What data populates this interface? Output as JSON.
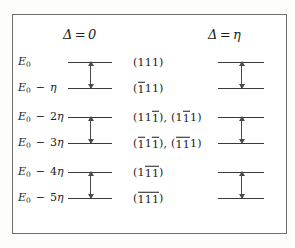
{
  "figure": {
    "kind": "energy-level-diagram",
    "columns": [
      {
        "id": "delta-zero",
        "symbol": "Δ",
        "equals": "=",
        "value": "0"
      },
      {
        "id": "delta-eta",
        "symbol": "Δ",
        "equals": "=",
        "value": "η"
      }
    ],
    "energy_labels": [
      {
        "base": "E",
        "sub": "0",
        "op": "",
        "coef": "",
        "unit": ""
      },
      {
        "base": "E",
        "sub": "0",
        "op": "−",
        "coef": "",
        "unit": "η"
      },
      {
        "base": "E",
        "sub": "0",
        "op": "−",
        "coef": "2",
        "unit": "η"
      },
      {
        "base": "E",
        "sub": "0",
        "op": "−",
        "coef": "3",
        "unit": "η"
      },
      {
        "base": "E",
        "sub": "0",
        "op": "−",
        "coef": "4",
        "unit": "η"
      },
      {
        "base": "E",
        "sub": "0",
        "op": "−",
        "coef": "5",
        "unit": "η"
      }
    ],
    "miller_labels": [
      {
        "row": 0,
        "groups": [
          {
            "open": "(",
            "digits": [
              {
                "d": "1",
                "bar": false
              },
              {
                "d": "1",
                "bar": false
              },
              {
                "d": "1",
                "bar": false
              }
            ],
            "close": ")"
          }
        ]
      },
      {
        "row": 1,
        "groups": [
          {
            "open": "(",
            "digits": [
              {
                "d": "1",
                "bar": true
              },
              {
                "d": "1",
                "bar": false
              },
              {
                "d": "1",
                "bar": false
              }
            ],
            "close": ")"
          }
        ]
      },
      {
        "row": 2,
        "groups": [
          {
            "open": "(",
            "digits": [
              {
                "d": "1",
                "bar": false
              },
              {
                "d": "1",
                "bar": false
              },
              {
                "d": "1",
                "bar": true
              }
            ],
            "close": ")"
          },
          {
            "open": "(",
            "digits": [
              {
                "d": "1",
                "bar": false
              },
              {
                "d": "1",
                "bar": true
              },
              {
                "d": "1",
                "bar": false
              }
            ],
            "close": ")"
          }
        ]
      },
      {
        "row": 3,
        "groups": [
          {
            "open": "(",
            "digits": [
              {
                "d": "1",
                "bar": true
              },
              {
                "d": "1",
                "bar": false
              },
              {
                "d": "1",
                "bar": true
              }
            ],
            "close": ")"
          },
          {
            "open": "(",
            "digits": [
              {
                "d": "1",
                "bar": true
              },
              {
                "d": "1",
                "bar": true
              },
              {
                "d": "1",
                "bar": false
              }
            ],
            "close": ")"
          }
        ]
      },
      {
        "row": 4,
        "groups": [
          {
            "open": "(",
            "digits": [
              {
                "d": "1",
                "bar": false
              },
              {
                "d": "1",
                "bar": true
              },
              {
                "d": "1",
                "bar": true
              }
            ],
            "close": ")"
          }
        ]
      },
      {
        "row": 5,
        "groups": [
          {
            "open": "(",
            "digits": [
              {
                "d": "1",
                "bar": true
              },
              {
                "d": "1",
                "bar": true
              },
              {
                "d": "1",
                "bar": true
              }
            ],
            "close": ")"
          }
        ]
      }
    ],
    "separator": ", ",
    "level_rows_y": [
      62,
      88,
      117,
      143,
      172,
      198
    ],
    "arrow_pairs": [
      [
        0,
        1
      ],
      [
        2,
        3
      ],
      [
        4,
        5
      ]
    ],
    "colors": {
      "frame": "#6e6e6e",
      "level": "#3a3a3a",
      "arrow": "#4a4a4a",
      "text": "#1b1b1b",
      "background": "#ffffff"
    }
  }
}
